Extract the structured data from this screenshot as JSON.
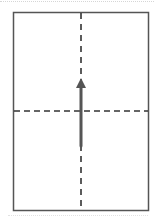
{
  "diagram": {
    "type": "paper-fold",
    "sheet": {
      "x": 13.5,
      "y": 12.5,
      "width": 135,
      "height": 198,
      "stroke": "#555555",
      "stroke_width": 1.5,
      "fill": "#ffffff"
    },
    "fold_lines": [
      {
        "orientation": "vertical",
        "x1": 81,
        "y1": 13,
        "x2": 81,
        "y2": 210,
        "style": "dashed",
        "dash": "6,5",
        "stroke": "#333333",
        "stroke_width": 1.6
      },
      {
        "orientation": "horizontal",
        "x1": 14,
        "y1": 111,
        "x2": 148,
        "y2": 111,
        "style": "dashed",
        "dash": "6,4",
        "stroke": "#333333",
        "stroke_width": 1.6
      }
    ],
    "arrow": {
      "direction": "up",
      "shaft": {
        "x": 81,
        "y_start": 146,
        "y_end": 87,
        "width": 3,
        "color": "#555555"
      },
      "head": {
        "points": "81,78 76,88 86,88",
        "color": "#555555"
      }
    }
  }
}
